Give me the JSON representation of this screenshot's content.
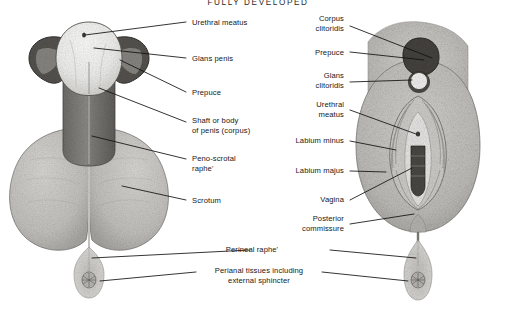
{
  "figure": {
    "title": "FULLY DEVELOPED",
    "kind": "anatomical-illustration",
    "background_color": "#ffffff",
    "ink_color": "#171717"
  },
  "male_labels": [
    {
      "id": "urethral-meatus",
      "text": "Urethral meatus",
      "x": 192,
      "y": 18,
      "align": "left"
    },
    {
      "id": "glans-penis",
      "text": "Glans penis",
      "x": 192,
      "y": 54,
      "align": "left"
    },
    {
      "id": "prepuce",
      "text": "Prepuce",
      "x": 192,
      "y": 88,
      "align": "left"
    },
    {
      "id": "shaft-of-penis",
      "text": "Shaft or body\nof penis (corpus)",
      "x": 192,
      "y": 116,
      "align": "left"
    },
    {
      "id": "peno-scrotal-raphe",
      "text": "Peno-scrotal\nraphe'",
      "x": 192,
      "y": 155,
      "align": "left"
    },
    {
      "id": "scrotum",
      "text": "Scrotum",
      "x": 192,
      "y": 196,
      "align": "left"
    }
  ],
  "female_labels": [
    {
      "id": "corpus-clitoridis",
      "text": "Corpus\nclitoridis",
      "x": 344,
      "y": 17,
      "align": "right"
    },
    {
      "id": "prepuce-f",
      "text": "Prepuce",
      "x": 344,
      "y": 48,
      "align": "right"
    },
    {
      "id": "glans-clitoridis",
      "text": "Glans\nclitoridis",
      "x": 344,
      "y": 74,
      "align": "right"
    },
    {
      "id": "urethral-meatus-f",
      "text": "Urethral\nmeatus",
      "x": 344,
      "y": 103,
      "align": "right"
    },
    {
      "id": "labium-minus",
      "text": "Labium minus",
      "x": 344,
      "y": 137,
      "align": "right"
    },
    {
      "id": "labium-majus",
      "text": "Labium majus",
      "x": 344,
      "y": 167,
      "align": "right"
    },
    {
      "id": "vagina",
      "text": "Vagina",
      "x": 344,
      "y": 196,
      "align": "right"
    },
    {
      "id": "posterior-commissure",
      "text": "Posterior\ncommissure",
      "x": 344,
      "y": 219,
      "align": "right"
    }
  ],
  "shared_labels": [
    {
      "id": "perineal-raphe",
      "text": "Perineal raphe'",
      "x": 258,
      "y": 248
    },
    {
      "id": "perianal-tissues",
      "text": "Perianal tissues including\nexternal sphincter",
      "x": 258,
      "y": 276
    }
  ],
  "anatomy_parts": {
    "male": [
      "glans-penis",
      "retracted-prepuce",
      "penile-shaft",
      "scrotum",
      "median-raphe",
      "perineal-raphe",
      "anus"
    ],
    "female": [
      "mons-prepuce",
      "glans-clitoridis",
      "labium-majus",
      "labium-minus",
      "vestibule",
      "vaginal-introitus",
      "posterior-commissure",
      "perineal-raphe",
      "anus"
    ]
  }
}
